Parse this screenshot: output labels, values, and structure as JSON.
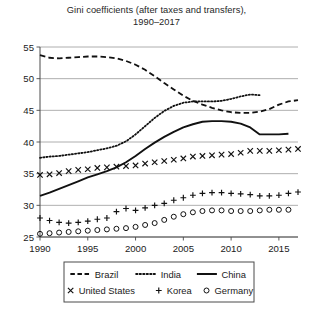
{
  "chart_data": {
    "type": "line",
    "title": "Gini coefficients (after taxes and transfers),",
    "subtitle": "1990–2017",
    "xlabel": "",
    "ylabel": "",
    "xlim": [
      1990,
      2017
    ],
    "ylim": [
      25,
      55
    ],
    "xticks": [
      1990,
      1995,
      2000,
      2005,
      2010,
      2015
    ],
    "yticks": [
      25,
      30,
      35,
      40,
      45,
      50,
      55
    ],
    "xtick_labels": [
      "1990",
      "1995",
      "2000",
      "2005",
      "2010",
      "2015"
    ],
    "ytick_labels": [
      "25",
      "30",
      "35",
      "40",
      "45",
      "50",
      "55"
    ],
    "grid": true,
    "grid_axis": "y",
    "legend_position": "bottom",
    "series": [
      {
        "name": "Brazil",
        "style": "dashed",
        "marker": "none",
        "color": "#111111",
        "x": [
          1990,
          1991,
          1992,
          1993,
          1994,
          1995,
          1996,
          1997,
          1998,
          1999,
          2000,
          2001,
          2002,
          2003,
          2004,
          2005,
          2006,
          2007,
          2008,
          2009,
          2010,
          2011,
          2012,
          2013,
          2014,
          2015,
          2016,
          2017
        ],
        "values": [
          53.7,
          53.3,
          53.2,
          53.3,
          53.4,
          53.5,
          53.5,
          53.4,
          53.2,
          52.8,
          52.2,
          51.4,
          50.4,
          49.3,
          48.3,
          47.3,
          46.5,
          45.9,
          45.4,
          45.0,
          44.7,
          44.6,
          44.6,
          44.8,
          45.2,
          45.9,
          46.4,
          46.6
        ]
      },
      {
        "name": "India",
        "style": "dotted",
        "marker": "none",
        "color": "#111111",
        "x": [
          1990,
          1991,
          1992,
          1993,
          1994,
          1995,
          1996,
          1997,
          1998,
          1999,
          2000,
          2001,
          2002,
          2003,
          2004,
          2005,
          2006,
          2007,
          2008,
          2009,
          2010,
          2011,
          2012,
          2013
        ],
        "values": [
          37.5,
          37.7,
          37.8,
          38.0,
          38.2,
          38.4,
          38.7,
          39.0,
          39.4,
          40.1,
          41.2,
          42.5,
          43.8,
          44.9,
          45.7,
          46.2,
          46.4,
          46.4,
          46.4,
          46.5,
          46.8,
          47.2,
          47.5,
          47.4
        ]
      },
      {
        "name": "China",
        "style": "solid",
        "marker": "none",
        "color": "#111111",
        "x": [
          1990,
          1991,
          1992,
          1993,
          1994,
          1995,
          1996,
          1997,
          1998,
          1999,
          2000,
          2001,
          2002,
          2003,
          2004,
          2005,
          2006,
          2007,
          2008,
          2009,
          2010,
          2011,
          2012,
          2013,
          2014,
          2015,
          2016
        ],
        "values": [
          31.5,
          32.0,
          32.6,
          33.2,
          33.8,
          34.4,
          34.9,
          35.4,
          36.0,
          36.8,
          37.8,
          38.9,
          39.9,
          40.8,
          41.6,
          42.3,
          42.8,
          43.2,
          43.3,
          43.3,
          43.2,
          42.9,
          42.3,
          41.2,
          41.2,
          41.2,
          41.3
        ]
      },
      {
        "name": "United States",
        "style": "none",
        "marker": "x",
        "color": "#111111",
        "x": [
          1990,
          1991,
          1992,
          1993,
          1994,
          1995,
          1996,
          1997,
          1998,
          1999,
          2000,
          2001,
          2002,
          2003,
          2004,
          2005,
          2006,
          2007,
          2008,
          2009,
          2010,
          2011,
          2012,
          2013,
          2014,
          2015,
          2016,
          2017
        ],
        "values": [
          34.8,
          34.9,
          35.1,
          35.4,
          35.6,
          35.7,
          35.9,
          36.0,
          36.1,
          36.2,
          36.3,
          36.6,
          36.8,
          37.0,
          37.2,
          37.4,
          37.7,
          37.8,
          37.9,
          38.0,
          38.1,
          38.3,
          38.6,
          38.6,
          38.6,
          38.7,
          38.8,
          38.9
        ]
      },
      {
        "name": "Korea",
        "style": "none",
        "marker": "+",
        "color": "#111111",
        "x": [
          1990,
          1991,
          1992,
          1993,
          1994,
          1995,
          1996,
          1997,
          1998,
          1999,
          2000,
          2001,
          2002,
          2003,
          2004,
          2005,
          2006,
          2007,
          2008,
          2009,
          2010,
          2011,
          2012,
          2013,
          2014,
          2015,
          2016,
          2017
        ],
        "values": [
          28.0,
          27.6,
          27.3,
          27.2,
          27.3,
          27.5,
          27.8,
          28.0,
          29.0,
          29.5,
          29.2,
          29.6,
          30.0,
          30.3,
          30.8,
          31.2,
          31.6,
          31.9,
          32.0,
          32.0,
          31.9,
          31.8,
          31.7,
          31.5,
          31.5,
          31.6,
          31.9,
          32.1
        ]
      },
      {
        "name": "Germany",
        "style": "none",
        "marker": "o",
        "color": "#111111",
        "x": [
          1990,
          1991,
          1992,
          1993,
          1994,
          1995,
          1996,
          1997,
          1998,
          1999,
          2000,
          2001,
          2002,
          2003,
          2004,
          2005,
          2006,
          2007,
          2008,
          2009,
          2010,
          2011,
          2012,
          2013,
          2014,
          2015,
          2016
        ],
        "values": [
          25.5,
          25.6,
          25.7,
          25.8,
          25.9,
          26.0,
          26.1,
          26.2,
          26.3,
          26.4,
          26.6,
          26.9,
          27.2,
          27.7,
          28.2,
          28.6,
          28.9,
          29.1,
          29.2,
          29.2,
          29.1,
          29.1,
          29.1,
          29.2,
          29.3,
          29.3,
          29.3
        ]
      }
    ]
  },
  "legend": {
    "row1": [
      {
        "label": "Brazil",
        "marker": "dashed-line"
      },
      {
        "label": "India",
        "marker": "dotted-line"
      },
      {
        "label": "China",
        "marker": "solid-line"
      }
    ],
    "row2": [
      {
        "label": "United States",
        "marker": "x-marker"
      },
      {
        "label": "Korea",
        "marker": "plus-marker"
      },
      {
        "label": "Germany",
        "marker": "circle-marker"
      }
    ]
  }
}
